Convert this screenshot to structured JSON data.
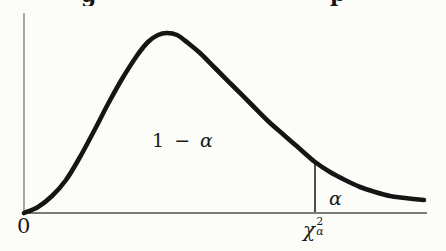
{
  "figure": {
    "background": "#fcfcf9",
    "colors": {
      "curve": "#151515",
      "x_axis": "#4f4f4f",
      "y_axis": "#7a7a7a",
      "critical_line": "#222222",
      "text": "#1a1a1a"
    },
    "top_fragments": [
      "g",
      "p"
    ],
    "labels": {
      "origin": "0",
      "body_area_prefix": "1 −",
      "body_area_alpha": "α",
      "tail_alpha": "α",
      "critical": {
        "chi": "χ",
        "sup": "2",
        "sub": "α"
      }
    }
  },
  "chart_data": {
    "type": "area",
    "title": "",
    "xlabel": "",
    "ylabel": "",
    "legend": "none",
    "grid": false,
    "x_ticks": [
      "0",
      "χα²"
    ],
    "region_labels": [
      "1 − α",
      "α"
    ],
    "axes_px": {
      "y_axis": {
        "x": 24,
        "y1": 13,
        "y2": 213
      },
      "x_axis": {
        "y": 213,
        "x1": 22,
        "x2": 427
      }
    },
    "critical_line_px": {
      "x": 315,
      "y1": 161,
      "y2": 212
    },
    "curve_points_px": [
      [
        24,
        213
      ],
      [
        38,
        207
      ],
      [
        52,
        196
      ],
      [
        66,
        180
      ],
      [
        80,
        157
      ],
      [
        94,
        131
      ],
      [
        108,
        104
      ],
      [
        122,
        79
      ],
      [
        136,
        57
      ],
      [
        148,
        42
      ],
      [
        158,
        35
      ],
      [
        167,
        33
      ],
      [
        177,
        35
      ],
      [
        188,
        43
      ],
      [
        200,
        53
      ],
      [
        215,
        68
      ],
      [
        232,
        85
      ],
      [
        250,
        103
      ],
      [
        268,
        121
      ],
      [
        285,
        136
      ],
      [
        300,
        149
      ],
      [
        315,
        162
      ],
      [
        330,
        172
      ],
      [
        345,
        180
      ],
      [
        360,
        187
      ],
      [
        375,
        192
      ],
      [
        390,
        196
      ],
      [
        405,
        198
      ],
      [
        424,
        200
      ]
    ]
  }
}
